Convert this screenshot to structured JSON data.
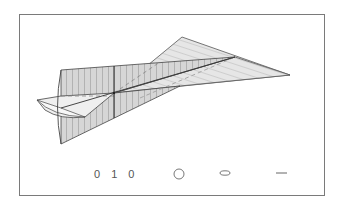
{
  "figure": {
    "type": "3D ruled-surface / cone projection diagram",
    "colors": {
      "frame": "#7a7a7a",
      "edge": "#444444",
      "fill": "#d9d9d9",
      "fill_light": "#e8e8e8",
      "hatch": "#9a9a9a",
      "dashed": "#888888"
    }
  },
  "legend": {
    "code_label": "0 1 0",
    "symbols": [
      "circle-icon",
      "ellipse-icon",
      "dash-icon"
    ]
  }
}
